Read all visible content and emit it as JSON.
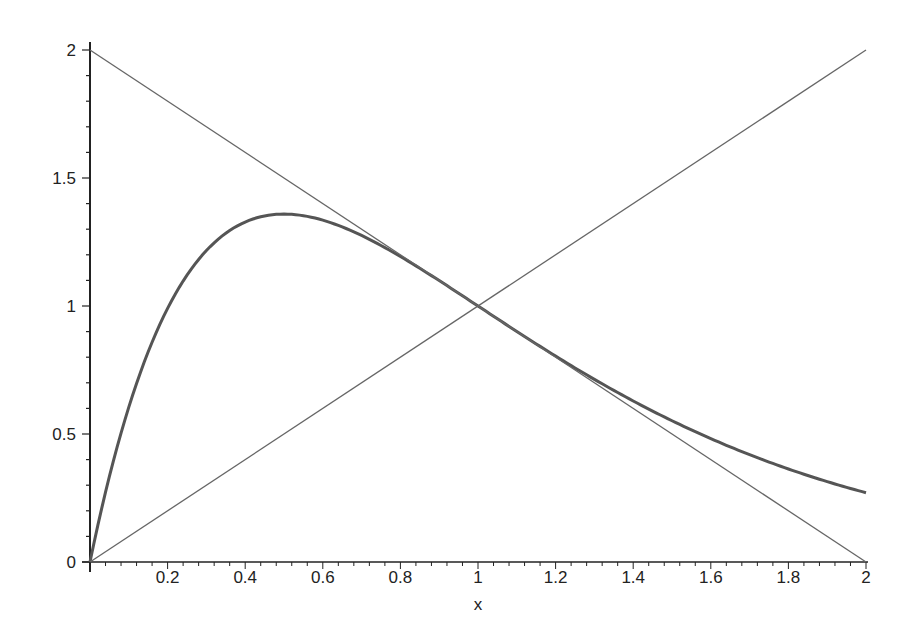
{
  "chart_data": {
    "type": "line",
    "title": "",
    "xlabel": "x",
    "ylabel": "",
    "xlim": [
      0,
      2
    ],
    "ylim": [
      0,
      2
    ],
    "grid": false,
    "legend": null,
    "x_ticks": [
      "0.2",
      "0.4",
      "0.6",
      "0.8",
      "1",
      "1.2",
      "1.4",
      "1.6",
      "1.8",
      "2"
    ],
    "x_tick_values": [
      0.2,
      0.4,
      0.6,
      0.8,
      1,
      1.2,
      1.4,
      1.6,
      1.8,
      2
    ],
    "y_ticks": [
      "0",
      "0.5",
      "1",
      "1.5",
      "2"
    ],
    "y_tick_values": [
      0,
      0.5,
      1,
      1.5,
      2
    ],
    "series": [
      {
        "name": "curve x*e^(2-2x)",
        "style": "thick",
        "x": [
          0,
          0.1,
          0.2,
          0.3,
          0.4,
          0.5,
          0.6,
          0.7,
          0.8,
          0.9,
          1.0,
          1.1,
          1.2,
          1.3,
          1.4,
          1.5,
          1.6,
          1.7,
          1.8,
          1.9,
          2.0
        ],
        "values": [
          0,
          0.495,
          0.664,
          0.742,
          0.442,
          1.359,
          1.342,
          1.276,
          1.193,
          1.099,
          1.0,
          0.901,
          0.804,
          0.713,
          0.629,
          0.552,
          0.482,
          0.42,
          0.364,
          0.316,
          0.271
        ]
      },
      {
        "name": "line y=x",
        "style": "thin",
        "x": [
          0,
          2
        ],
        "values": [
          0,
          2
        ]
      },
      {
        "name": "line y=2-x",
        "style": "thin",
        "x": [
          0,
          2
        ],
        "values": [
          2,
          0
        ]
      }
    ]
  },
  "axes": {
    "x_label": "x",
    "origin_label": "0"
  }
}
